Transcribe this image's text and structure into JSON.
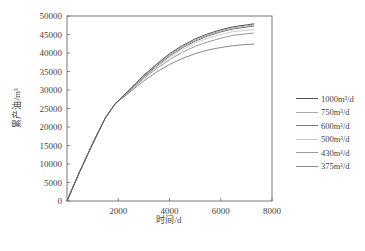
{
  "chart_data": {
    "type": "line",
    "title": "",
    "xlabel": "时间/d",
    "ylabel": "累产油/m³",
    "xlim": [
      0,
      8000
    ],
    "ylim": [
      0,
      50000
    ],
    "xticks": [
      2000,
      4000,
      6000,
      8000
    ],
    "yticks": [
      0,
      5000,
      10000,
      15000,
      20000,
      25000,
      30000,
      35000,
      40000,
      45000,
      50000
    ],
    "grid": false,
    "legend_position": "right",
    "x": [
      0,
      500,
      1000,
      1500,
      1870,
      2500,
      3000,
      3500,
      4000,
      4500,
      5000,
      5500,
      6000,
      6500,
      7000,
      7300
    ],
    "series": [
      {
        "name": "1000m³/d",
        "color": "#555555",
        "values": [
          0,
          8000,
          15500,
          22500,
          26200,
          30500,
          34000,
          37000,
          39800,
          42000,
          43800,
          45200,
          46300,
          47100,
          47600,
          47900
        ]
      },
      {
        "name": "750m³/d",
        "color": "#aaaaaa",
        "values": [
          0,
          8000,
          15500,
          22500,
          26200,
          30400,
          33800,
          36800,
          39500,
          41700,
          43500,
          44900,
          46000,
          46800,
          47300,
          47600
        ]
      },
      {
        "name": "600m³/d",
        "color": "#777777",
        "values": [
          0,
          8000,
          15500,
          22500,
          26200,
          30300,
          33600,
          36500,
          39200,
          41400,
          43200,
          44600,
          45700,
          46500,
          47000,
          47300
        ]
      },
      {
        "name": "500m³/d",
        "color": "#cccccc",
        "values": [
          0,
          8000,
          15500,
          22500,
          26200,
          30200,
          33400,
          36200,
          38800,
          40900,
          42700,
          44000,
          45000,
          45800,
          46100,
          46300
        ]
      },
      {
        "name": "430m³/d",
        "color": "#999999",
        "values": [
          0,
          8000,
          15500,
          22500,
          26200,
          30000,
          33100,
          35800,
          38200,
          40200,
          41800,
          43000,
          44000,
          44800,
          45200,
          45400
        ]
      },
      {
        "name": "375m³/d",
        "color": "#888888",
        "values": [
          0,
          8000,
          15500,
          22500,
          26200,
          29700,
          32500,
          34900,
          36900,
          38500,
          39800,
          40800,
          41500,
          42000,
          42300,
          42400
        ]
      }
    ]
  },
  "axes": {
    "xlabel": "时间/d",
    "ylabel": "累产油/m³"
  },
  "legend": {
    "items": [
      {
        "label": "1000m³/d",
        "color": "#555555"
      },
      {
        "label": "750m³/d",
        "color": "#aaaaaa"
      },
      {
        "label": "600m³/d",
        "color": "#777777"
      },
      {
        "label": "500m³/d",
        "color": "#cccccc"
      },
      {
        "label": "430m³/d",
        "color": "#999999"
      },
      {
        "label": "375m³/d",
        "color": "#888888"
      }
    ]
  }
}
